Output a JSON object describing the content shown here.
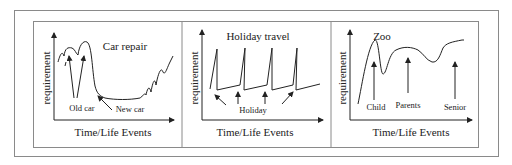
{
  "figure": {
    "panels": [
      {
        "id": "car-repair",
        "title": "Car repair",
        "xlabel": "Time/Life Events",
        "ylabel": "requirement",
        "annotations": [
          "Old car",
          "New car"
        ]
      },
      {
        "id": "holiday-travel",
        "title": "Holiday travel",
        "xlabel": "Time/Life Events",
        "ylabel": "requirement",
        "annotations": [
          "Holiday"
        ]
      },
      {
        "id": "zoo",
        "title": "Zoo",
        "xlabel": "Time/Life Events",
        "ylabel": "requirement",
        "annotations": [
          "Child",
          "Parents",
          "Senior"
        ]
      }
    ]
  },
  "colors": {
    "line": "#222222",
    "frame": "#8a8a8a"
  }
}
